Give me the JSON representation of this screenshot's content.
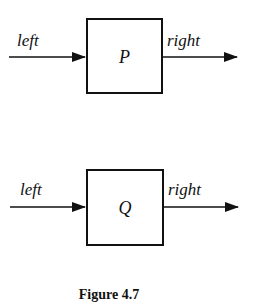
{
  "diagram": {
    "blocks": [
      {
        "name": "P",
        "input_label": "left",
        "output_label": "right"
      },
      {
        "name": "Q",
        "input_label": "left",
        "output_label": "right"
      }
    ],
    "caption": "Figure 4.7"
  }
}
